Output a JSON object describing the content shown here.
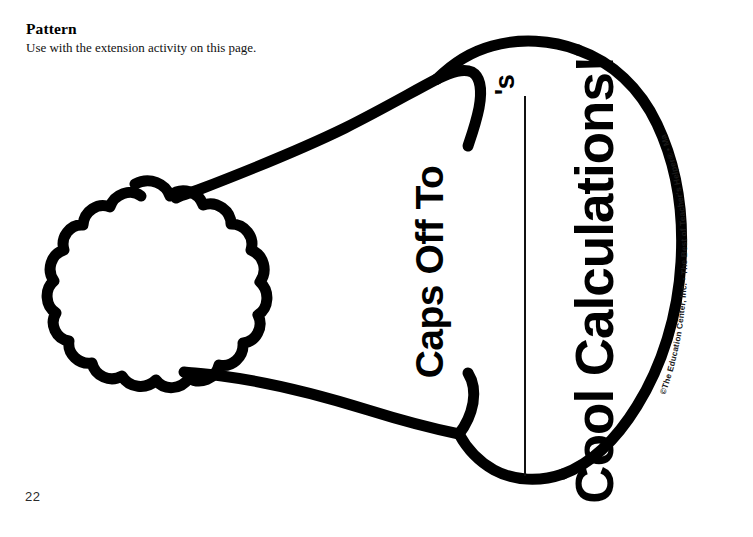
{
  "page": {
    "number": "22",
    "background_color": "#ffffff",
    "ink_color": "#000000"
  },
  "header": {
    "title": "Pattern",
    "subtitle": "Use with the extension activity on this page."
  },
  "pattern": {
    "name": "graduation-cap-pattern",
    "description": "Outline drawing of a graduation cap with a pom-pom tassel on the left",
    "parts": {
      "pom_pom": "pom-pom",
      "cap_body": "cap-body",
      "cap_brim": "cap-brim"
    }
  },
  "captions": {
    "name_blank_suffix": "'s",
    "line_1": "Caps Off To",
    "line_2": "Cool Calculations!",
    "write_on_line": ""
  },
  "credit": {
    "symbol": "©",
    "publisher": "The Education Center, Inc.",
    "separator_1": " • ",
    "series": "The Best of Teacher's Helper",
    "registered_mark": "®",
    "separator_2": " • ",
    "subject": "Math",
    "separator_3": " • ",
    "product_code": "TEC3212",
    "full_text": "©The Education Center, Inc. • The Best of Teacher's Helper® • Math • TEC3212"
  }
}
